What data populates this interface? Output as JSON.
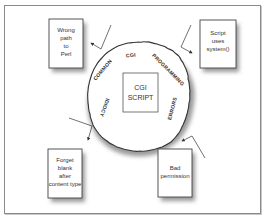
{
  "diagram": {
    "center": {
      "lines": [
        "CGI",
        "SCRIPT"
      ]
    },
    "ring": {
      "words": [
        "COMMON",
        "CGI",
        "PROGRAMMING",
        "ERRORS",
        "IDIOCY"
      ]
    },
    "boxes": [
      {
        "id": "wrong-path",
        "lines": [
          "Wrong",
          "path",
          "to",
          "Perl"
        ]
      },
      {
        "id": "script-system",
        "lines": [
          "Script",
          "uses",
          "system()"
        ]
      },
      {
        "id": "forget-blank",
        "lines": [
          "Forget",
          "blank",
          "after",
          "content type"
        ]
      },
      {
        "id": "bad-permission",
        "lines": [
          "Bad",
          "permission"
        ]
      }
    ],
    "colors": {
      "stroke": "#333333",
      "frame": "#8a8a8a",
      "shadow": "#bbbbbb"
    }
  }
}
